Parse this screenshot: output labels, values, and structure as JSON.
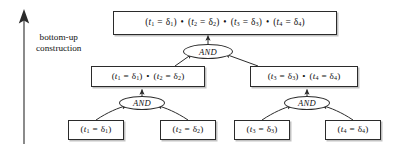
{
  "diagram": {
    "side_label": {
      "line1": "bottom-up",
      "line2": "construction",
      "arrow": "upward-arrow"
    },
    "colors": {
      "background": "#ffffff",
      "stroke": "#2b2b2b",
      "text": "#111111",
      "shadow": "rgba(120,120,120,0.45)"
    },
    "gate_label": "AND",
    "nodes": {
      "root": {
        "id": "root",
        "terms": [
          {
            "lhs": "t",
            "lhs_sub": "1",
            "op": "=",
            "rhs": "δ",
            "rhs_sub": "1"
          },
          {
            "lhs": "t",
            "lhs_sub": "2",
            "op": "=",
            "rhs": "δ",
            "rhs_sub": "2"
          },
          {
            "lhs": "t",
            "lhs_sub": "3",
            "op": "=",
            "rhs": "δ",
            "rhs_sub": "3"
          },
          {
            "lhs": "t",
            "lhs_sub": "4",
            "op": "=",
            "rhs": "δ",
            "rhs_sub": "4"
          }
        ],
        "text": "(t1 = δ1) • (t2 = δ2) • (t3 = δ3) • (t4 = δ4)"
      },
      "mid_left": {
        "id": "mid-left",
        "terms": [
          {
            "lhs": "t",
            "lhs_sub": "1",
            "op": "=",
            "rhs": "δ",
            "rhs_sub": "1"
          },
          {
            "lhs": "t",
            "lhs_sub": "2",
            "op": "=",
            "rhs": "δ",
            "rhs_sub": "2"
          }
        ],
        "text": "(t1 = δ1) • (t2 = δ2)"
      },
      "mid_right": {
        "id": "mid-right",
        "terms": [
          {
            "lhs": "t",
            "lhs_sub": "3",
            "op": "=",
            "rhs": "δ",
            "rhs_sub": "3"
          },
          {
            "lhs": "t",
            "lhs_sub": "4",
            "op": "=",
            "rhs": "δ",
            "rhs_sub": "4"
          }
        ],
        "text": "(t3 = δ3) • (t4 = δ4)"
      },
      "leaf1": {
        "id": "leaf-1",
        "terms": [
          {
            "lhs": "t",
            "lhs_sub": "1",
            "op": "=",
            "rhs": "δ",
            "rhs_sub": "1"
          }
        ],
        "text": "(t1 = δ1)"
      },
      "leaf2": {
        "id": "leaf-2",
        "terms": [
          {
            "lhs": "t",
            "lhs_sub": "2",
            "op": "=",
            "rhs": "δ",
            "rhs_sub": "2"
          }
        ],
        "text": "(t2 = δ2)"
      },
      "leaf3": {
        "id": "leaf-3",
        "terms": [
          {
            "lhs": "t",
            "lhs_sub": "3",
            "op": "=",
            "rhs": "δ",
            "rhs_sub": "3"
          }
        ],
        "text": "(t3 = δ3)"
      },
      "leaf4": {
        "id": "leaf-4",
        "terms": [
          {
            "lhs": "t",
            "lhs_sub": "4",
            "op": "=",
            "rhs": "δ",
            "rhs_sub": "4"
          }
        ],
        "text": "(t4 = δ4)"
      }
    },
    "gates": {
      "top": {
        "id": "and-top",
        "label": "AND"
      },
      "bottom_left": {
        "id": "and-bottom-left",
        "label": "AND"
      },
      "bottom_right": {
        "id": "and-bottom-right",
        "label": "AND"
      }
    }
  }
}
